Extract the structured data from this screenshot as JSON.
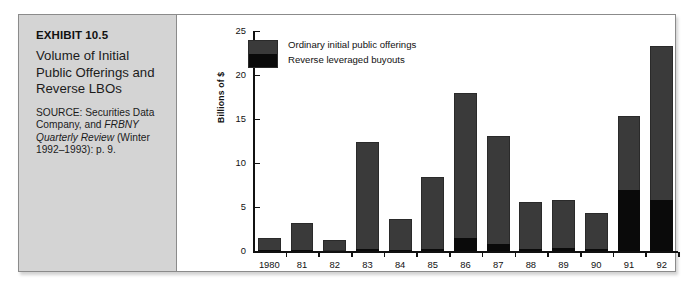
{
  "exhibit": {
    "number": "EXHIBIT 10.5",
    "title": "Volume of Initial Public Offerings and Reverse LBOs",
    "source_line1": "SOURCE: Securities Data Company, and ",
    "source_italic": "FRBNY Quarterly Review",
    "source_line2": " (Winter 1992–1993): p. 9."
  },
  "chart_data": {
    "type": "bar",
    "stacked": true,
    "title": "Volume of Initial Public Offerings and Reverse LBOs",
    "xlabel": "",
    "ylabel": "Billions of $",
    "ylim": [
      0,
      25
    ],
    "yticks": [
      0,
      5,
      10,
      15,
      20,
      25
    ],
    "grid": false,
    "legend_position": "top-left",
    "categories": [
      "1980",
      "81",
      "82",
      "83",
      "84",
      "85",
      "86",
      "87",
      "88",
      "89",
      "90",
      "91",
      "92"
    ],
    "series": [
      {
        "name": "Ordinary initial public offerings",
        "color": "#3a3a3a",
        "values": [
          1.4,
          3.1,
          1.2,
          12.2,
          3.5,
          8.2,
          16.4,
          12.3,
          5.4,
          5.5,
          4.1,
          8.4,
          17.5
        ]
      },
      {
        "name": "Reverse leveraged buyouts",
        "color": "#0a0a0a",
        "values": [
          0.1,
          0.1,
          0.0,
          0.2,
          0.1,
          0.2,
          1.5,
          0.8,
          0.2,
          0.3,
          0.2,
          6.9,
          5.8
        ]
      }
    ],
    "totals": [
      1.5,
      3.2,
      1.2,
      12.4,
      3.6,
      8.4,
      17.9,
      13.1,
      5.6,
      5.8,
      4.3,
      15.3,
      23.3
    ]
  }
}
